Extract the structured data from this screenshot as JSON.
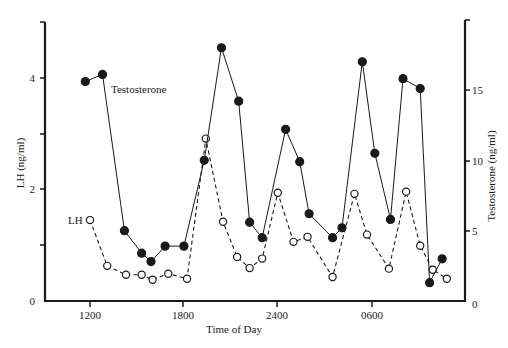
{
  "chart_data": {
    "type": "line",
    "title": "",
    "xlabel": "Time of Day",
    "ylabel": "LH (ng/ml)",
    "ylabel_right": "Testosterone (ng/ml)",
    "x_ticks": [
      "1200",
      "1800",
      "2400",
      "0600"
    ],
    "y_ticks_left": [
      "0",
      "2",
      "4"
    ],
    "y_ticks_right": [
      "0",
      "5",
      "10",
      "15"
    ],
    "ylim_left": [
      0,
      5
    ],
    "ylim_right": [
      0,
      20
    ],
    "grid": false,
    "legend": "inline labels",
    "x_hours": [
      11.7,
      12.8,
      14.2,
      15.3,
      15.9,
      16.8,
      18.0,
      19.3,
      20.4,
      21.5,
      22.2,
      23.0,
      24.5,
      25.4,
      26.0,
      27.5,
      28.1,
      29.4,
      30.2,
      31.2,
      32.0,
      33.1,
      33.7,
      34.5
    ],
    "series": [
      {
        "name": "Testosterone",
        "axis": "right",
        "marker": "filled-circle",
        "line": "solid",
        "points": [
          {
            "hour": 11.7,
            "value": 15.6
          },
          {
            "hour": 12.8,
            "value": 16.1
          },
          {
            "hour": 14.2,
            "value": 5.0
          },
          {
            "hour": 15.3,
            "value": 3.4
          },
          {
            "hour": 15.9,
            "value": 2.8
          },
          {
            "hour": 16.8,
            "value": 3.9
          },
          {
            "hour": 18.0,
            "value": 3.9
          },
          {
            "hour": 19.3,
            "value": 10.0
          },
          {
            "hour": 20.4,
            "value": 18.0
          },
          {
            "hour": 21.5,
            "value": 14.2
          },
          {
            "hour": 22.2,
            "value": 5.6
          },
          {
            "hour": 23.0,
            "value": 4.5
          },
          {
            "hour": 24.5,
            "value": 12.2
          },
          {
            "hour": 25.4,
            "value": 9.9
          },
          {
            "hour": 26.0,
            "value": 6.2
          },
          {
            "hour": 27.5,
            "value": 4.5
          },
          {
            "hour": 28.1,
            "value": 5.2
          },
          {
            "hour": 29.4,
            "value": 17.0
          },
          {
            "hour": 30.2,
            "value": 10.5
          },
          {
            "hour": 31.2,
            "value": 5.8
          },
          {
            "hour": 32.0,
            "value": 15.8
          },
          {
            "hour": 33.1,
            "value": 15.1
          },
          {
            "hour": 33.7,
            "value": 1.3
          },
          {
            "hour": 34.5,
            "value": 3.0
          }
        ]
      },
      {
        "name": "LH",
        "axis": "left",
        "marker": "open-circle",
        "line": "dashed",
        "points": [
          {
            "hour": 12.0,
            "value": 1.45
          },
          {
            "hour": 13.1,
            "value": 0.63
          },
          {
            "hour": 14.3,
            "value": 0.47
          },
          {
            "hour": 15.3,
            "value": 0.47
          },
          {
            "hour": 16.0,
            "value": 0.38
          },
          {
            "hour": 17.0,
            "value": 0.49
          },
          {
            "hour": 18.2,
            "value": 0.4
          },
          {
            "hour": 19.4,
            "value": 2.91
          },
          {
            "hour": 20.5,
            "value": 1.42
          },
          {
            "hour": 21.4,
            "value": 0.79
          },
          {
            "hour": 22.2,
            "value": 0.59
          },
          {
            "hour": 23.0,
            "value": 0.76
          },
          {
            "hour": 24.0,
            "value": 1.94
          },
          {
            "hour": 25.0,
            "value": 1.06
          },
          {
            "hour": 25.9,
            "value": 1.15
          },
          {
            "hour": 27.5,
            "value": 0.43
          },
          {
            "hour": 28.9,
            "value": 1.92
          },
          {
            "hour": 29.7,
            "value": 1.19
          },
          {
            "hour": 31.1,
            "value": 0.58
          },
          {
            "hour": 32.2,
            "value": 1.96
          },
          {
            "hour": 33.1,
            "value": 0.99
          },
          {
            "hour": 33.9,
            "value": 0.56
          },
          {
            "hour": 34.8,
            "value": 0.4
          }
        ]
      }
    ]
  },
  "labels": {
    "series_testosterone": "Testosterone",
    "series_lh": "LH",
    "x_axis_title": "Time of Day",
    "y_axis_left_title": "LH (ng/ml)",
    "y_axis_right_title": "Testosterone (ng/ml)"
  },
  "colors": {
    "ink": "#1a1a1a",
    "background": "#ffffff"
  }
}
